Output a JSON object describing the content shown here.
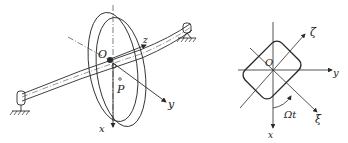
{
  "left_figure": {
    "description": "Rotor disk on flexible shaft with bearings",
    "labels": {
      "origin": "O",
      "point": "P",
      "axis_x": "x",
      "axis_y": "y",
      "axis_z": "z"
    }
  },
  "right_figure": {
    "description": "Cross-section of disk with rotating frame",
    "labels": {
      "origin": "O",
      "axis_x": "x",
      "axis_y": "y",
      "axis_zeta": "ζ",
      "axis_xi": "ξ",
      "angle": "Ωt"
    }
  },
  "colors": {
    "line": "#2a2a2a",
    "background": "#ffffff"
  }
}
